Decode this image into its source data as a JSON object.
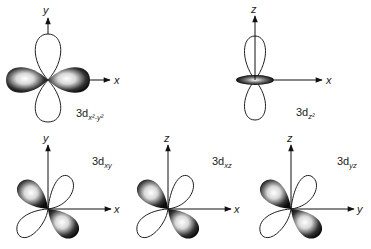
{
  "figure": {
    "orbitals": [
      {
        "id": "dx2y2",
        "label_prefix": "3d",
        "label_sub": "x²-y²",
        "axes": {
          "horizontal": "x",
          "vertical": "y"
        }
      },
      {
        "id": "dz2",
        "label_prefix": "3d",
        "label_sub": "z²",
        "axes": {
          "horizontal": "x",
          "vertical": "z"
        }
      },
      {
        "id": "dxy",
        "label_prefix": "3d",
        "label_sub": "xy",
        "axes": {
          "horizontal": "x",
          "vertical": "y"
        }
      },
      {
        "id": "dxz",
        "label_prefix": "3d",
        "label_sub": "xz",
        "axes": {
          "horizontal": "x",
          "vertical": "z"
        }
      },
      {
        "id": "dyz",
        "label_prefix": "3d",
        "label_sub": "yz",
        "axes": {
          "horizontal": "y",
          "vertical": "z"
        }
      }
    ],
    "colors": {
      "lobe_dark": "#111111",
      "lobe_light": "#f4f4f4",
      "outline": "#222222",
      "background": "#ffffff"
    }
  }
}
